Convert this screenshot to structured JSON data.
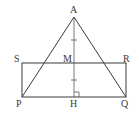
{
  "diagram": {
    "type": "geometry",
    "points": {
      "A": {
        "label": "A",
        "x": 74,
        "y": 17
      },
      "S": {
        "label": "S",
        "x": 22,
        "y": 63
      },
      "M": {
        "label": "M",
        "x": 74,
        "y": 63
      },
      "R": {
        "label": "R",
        "x": 126,
        "y": 63
      },
      "P": {
        "label": "P",
        "x": 22,
        "y": 97
      },
      "H": {
        "label": "H",
        "x": 74,
        "y": 97
      },
      "Q": {
        "label": "Q",
        "x": 126,
        "y": 97
      }
    },
    "segments": [
      "AP",
      "AQ",
      "SR",
      "PQ",
      "SP",
      "RQ",
      "AH"
    ],
    "marks": {
      "equal_ticks": [
        "AM",
        "MH"
      ],
      "right_angle": "AHQ"
    },
    "stroke_color": "#3a3a3a"
  }
}
